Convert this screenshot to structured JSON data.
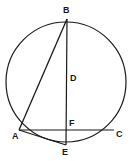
{
  "figure": {
    "kind": "circle-geometry-diagram",
    "background_color": "#ffffff",
    "stroke_color": "#1a1a1a",
    "label_color": "#1a1a1a",
    "canvas": {
      "width": 131,
      "height": 161
    },
    "circle": {
      "cx": 66,
      "cy": 82,
      "r": 60,
      "stroke_width": 1.2
    },
    "points": [
      {
        "id": "B",
        "label": "B",
        "x": 67,
        "y": 19,
        "label_x": 63,
        "label_y": 6
      },
      {
        "id": "D",
        "label": "D",
        "x": 67,
        "y": 82,
        "label_x": 70,
        "label_y": 74
      },
      {
        "id": "F",
        "label": "F",
        "x": 66,
        "y": 130,
        "label_x": 69,
        "label_y": 119
      },
      {
        "id": "A",
        "label": "A",
        "x": 19,
        "y": 130,
        "label_x": 12,
        "label_y": 132
      },
      {
        "id": "C",
        "label": "C",
        "x": 114,
        "y": 130,
        "label_x": 116,
        "label_y": 130
      },
      {
        "id": "E",
        "label": "E",
        "x": 66,
        "y": 145,
        "label_x": 62,
        "label_y": 148
      }
    ],
    "segments": [
      {
        "id": "BA",
        "from": "B",
        "to": "A",
        "x1": 67,
        "y1": 19,
        "x2": 19,
        "y2": 130
      },
      {
        "id": "BE",
        "from": "B",
        "to": "E",
        "x1": 67,
        "y1": 19,
        "x2": 66,
        "y2": 145
      },
      {
        "id": "AC",
        "from": "A",
        "to": "C",
        "x1": 19,
        "y1": 130,
        "x2": 114,
        "y2": 130
      },
      {
        "id": "AE",
        "from": "A",
        "to": "E",
        "x1": 19,
        "y1": 130,
        "x2": 66,
        "y2": 145
      }
    ]
  }
}
